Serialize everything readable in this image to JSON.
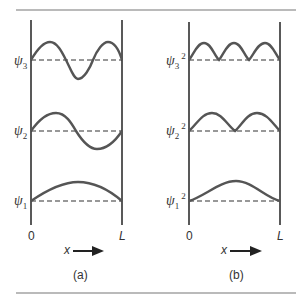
{
  "figure": {
    "panels": [
      {
        "caption": "(a)",
        "labels": [
          {
            "symbol": "ψ",
            "sub": "3",
            "sup": ""
          },
          {
            "symbol": "ψ",
            "sub": "2",
            "sup": ""
          },
          {
            "symbol": "ψ",
            "sub": "1",
            "sup": ""
          }
        ],
        "x_start": "0",
        "x_end": "L",
        "x_axis_label": "x"
      },
      {
        "caption": "(b)",
        "labels": [
          {
            "symbol": "ψ",
            "sub": "3",
            "sup": "2"
          },
          {
            "symbol": "ψ",
            "sub": "2",
            "sup": "2"
          },
          {
            "symbol": "ψ",
            "sub": "1",
            "sup": "2"
          }
        ],
        "x_start": "0",
        "x_end": "L",
        "x_axis_label": "x"
      }
    ],
    "colors": {
      "curve": "#555555",
      "wall": "#222222",
      "rule": "#777777"
    }
  }
}
